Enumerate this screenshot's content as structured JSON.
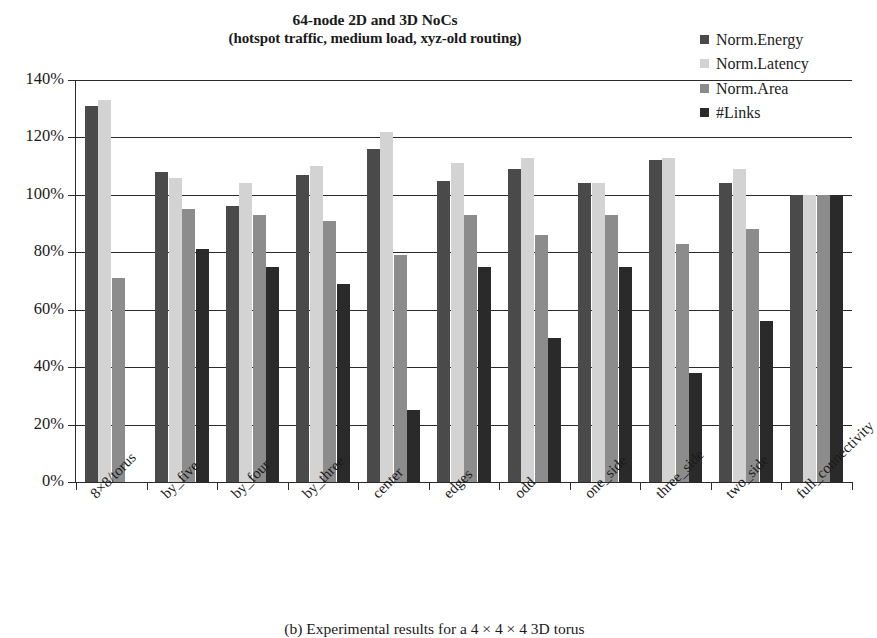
{
  "title": {
    "line1": "64-node 2D and 3D NoCs",
    "line2": "(hotspot traffic, medium load, xyz-old routing)"
  },
  "caption": "(b) Experimental results for a 4 × 4 × 4 3D torus",
  "legend": {
    "position": "top-right",
    "items": [
      {
        "label": "Norm.Energy",
        "color": "#4a4a4a",
        "icon": "legend-square-icon"
      },
      {
        "label": "Norm.Latency",
        "color": "#d3d3d3",
        "icon": "legend-square-icon"
      },
      {
        "label": "Norm.Area",
        "color": "#8c8c8c",
        "icon": "legend-square-icon"
      },
      {
        "label": "#Links",
        "color": "#2a2a2a",
        "icon": "legend-square-icon"
      }
    ]
  },
  "axis": {
    "y_ticks": [
      "0%",
      "20%",
      "40%",
      "60%",
      "80%",
      "100%",
      "120%",
      "140%"
    ],
    "y_min": 0,
    "y_max": 140
  },
  "chart_data": {
    "type": "bar",
    "title": "64-node 2D and 3D NoCs (hotspot traffic, medium load, xyz-old routing)",
    "xlabel": "",
    "ylabel": "",
    "ylim": [
      0,
      140
    ],
    "ytick_step": 20,
    "y_unit": "%",
    "grid": true,
    "legend_position": "top-right",
    "categories": [
      "8×8/torus",
      "by_five",
      "by_four",
      "by_three",
      "center",
      "edges",
      "odd",
      "one_side",
      "three_side",
      "two_side",
      "full_connectivity"
    ],
    "series": [
      {
        "name": "Norm.Energy",
        "color": "#4a4a4a",
        "values": [
          131,
          108,
          96,
          107,
          116,
          105,
          109,
          104,
          112,
          104,
          100
        ]
      },
      {
        "name": "Norm.Latency",
        "color": "#d3d3d3",
        "values": [
          133,
          106,
          104,
          110,
          122,
          111,
          113,
          104,
          113,
          109,
          100
        ]
      },
      {
        "name": "Norm.Area",
        "color": "#8c8c8c",
        "values": [
          71,
          95,
          93,
          91,
          79,
          93,
          86,
          93,
          83,
          88,
          100
        ]
      },
      {
        "name": "#Links",
        "color": "#2a2a2a",
        "values": [
          null,
          81,
          75,
          69,
          25,
          75,
          50,
          75,
          38,
          56,
          100
        ]
      }
    ]
  }
}
